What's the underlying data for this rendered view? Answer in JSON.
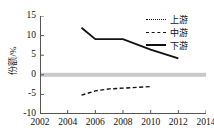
{
  "chart_data": {
    "type": "line",
    "title": "",
    "xlabel": "",
    "ylabel": "份额/%",
    "xlim": [
      2002,
      2014
    ],
    "ylim": [
      -10,
      15
    ],
    "xticks": [
      "2002",
      "2004",
      "2006",
      "2008",
      "2010",
      "2012",
      "2014"
    ],
    "yticks": [
      "15",
      "10",
      "5",
      "0",
      "-5",
      "-10"
    ],
    "grid": false,
    "legend_position": "top-right",
    "zero_reference_band": {
      "value": 0,
      "color": "#c9c9c9"
    },
    "series": [
      {
        "name": "上游",
        "style": "dotted",
        "color": "#111111",
        "x": [],
        "values": []
      },
      {
        "name": "中游",
        "style": "dashed",
        "color": "#111111",
        "x": [
          2005,
          2006,
          2007,
          2008,
          2009,
          2010
        ],
        "values": [
          -5.2,
          -4.1,
          -3.6,
          -3.4,
          -3.2,
          -3.0
        ]
      },
      {
        "name": "下游",
        "style": "solid",
        "color": "#111111",
        "x": [
          2005,
          2006,
          2008,
          2010,
          2012
        ],
        "values": [
          12.0,
          9.1,
          9.1,
          6.4,
          4.2
        ]
      }
    ]
  },
  "legend": {
    "items": [
      {
        "label": "上游",
        "style": "dotted"
      },
      {
        "label": "中游",
        "style": "dashed"
      },
      {
        "label": "下游",
        "style": "solid"
      }
    ]
  }
}
